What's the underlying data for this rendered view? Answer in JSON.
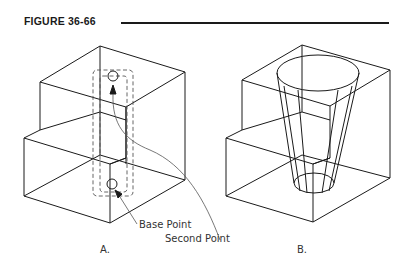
{
  "figure": {
    "title": "FIGURE 36-66"
  },
  "panels": [
    {
      "id": "A",
      "label": "A.",
      "callouts": [
        "Base Point",
        "Second Point"
      ],
      "description": "Stepped block with dashed selection rectangles, base point circle at bottom and second point circle at top with arrows"
    },
    {
      "id": "B",
      "label": "B.",
      "description": "Stepped block with a tapered cone extruded through it"
    }
  ],
  "colors": {
    "line": "#1a1a1a",
    "dash": "#555555",
    "text": "#333333"
  }
}
